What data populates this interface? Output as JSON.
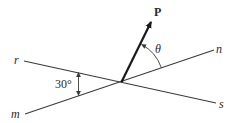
{
  "diagram": {
    "colors": {
      "line": "#3a3a3a",
      "vector": "#1a1a1a",
      "text": "#2a2a2a",
      "background": "#ffffff"
    },
    "intersection": {
      "x": 122,
      "y": 81
    },
    "lines": [
      {
        "id": "r-s",
        "from_label": "r",
        "to_label": "s",
        "x1": 24,
        "y1": 61,
        "x2": 216,
        "y2": 103
      },
      {
        "id": "m-n",
        "from_label": "m",
        "to_label": "n",
        "x1": 25,
        "y1": 114,
        "x2": 214,
        "y2": 50
      }
    ],
    "vector": {
      "label": "P",
      "x1": 122,
      "y1": 81,
      "x2": 152,
      "y2": 20
    },
    "labels": {
      "r": "r",
      "m": "m",
      "n": "n",
      "s": "s",
      "P": "P",
      "theta": "θ",
      "angle_between_lines": "30°"
    },
    "angles": {
      "between_r_and_m": {
        "value_deg": 30,
        "text": "30°"
      },
      "theta": {
        "symbol": "θ",
        "between": [
          "P",
          "n"
        ]
      }
    }
  }
}
